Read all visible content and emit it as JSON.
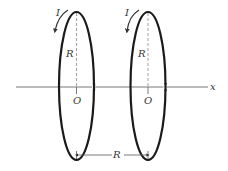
{
  "diagram": {
    "colors": {
      "stroke": "#1a1a1a",
      "dashed": "#888888",
      "axis": "#555555"
    },
    "axis": {
      "label": "x"
    },
    "loops": [
      {
        "current_label": "I",
        "radius_label": "R",
        "center_label": "O"
      },
      {
        "current_label": "I",
        "radius_label": "R",
        "center_label": "O"
      }
    ],
    "separation_label": "R"
  }
}
